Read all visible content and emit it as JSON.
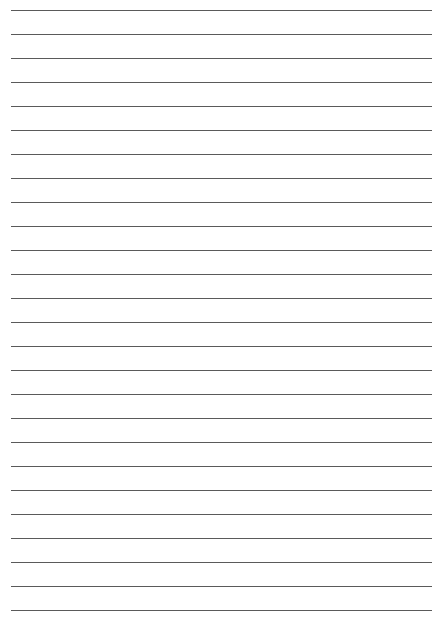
{
  "page": {
    "type": "lined-paper",
    "background_color": "#ffffff",
    "line_color": "#5a5a5a",
    "line_count": 26,
    "first_line_y": 10,
    "line_spacing": 24,
    "line_left": 11,
    "line_right": 432
  }
}
